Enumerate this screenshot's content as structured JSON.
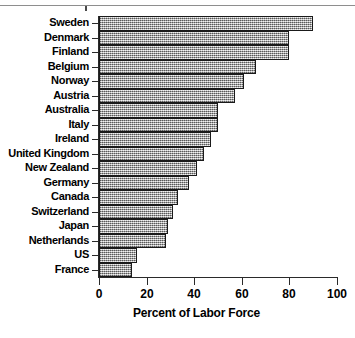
{
  "chart_data": {
    "type": "bar",
    "orientation": "horizontal",
    "title": "",
    "xlabel": "Percent of Labor Force",
    "ylabel": "",
    "xlim": [
      0,
      100
    ],
    "xticks": [
      "0",
      "20",
      "40",
      "60",
      "80",
      "100"
    ],
    "xtick_values": [
      0,
      20,
      40,
      60,
      80,
      100
    ],
    "grid": false,
    "legend": null,
    "categories": [
      "Sweden",
      "Denmark",
      "Finland",
      "Belgium",
      "Norway",
      "Austria",
      "Australia",
      "Italy",
      "Ireland",
      "United Kingdom",
      "New Zealand",
      "Germany",
      "Canada",
      "Switzerland",
      "Japan",
      "Netherlands",
      "US",
      "France"
    ],
    "values": [
      90,
      80,
      80,
      66,
      61,
      57,
      50,
      50,
      47,
      44,
      41,
      38,
      33,
      31,
      29,
      28,
      16,
      14
    ],
    "bar_fill": "#b7b7b7",
    "bar_border": "#1a1a1a"
  }
}
